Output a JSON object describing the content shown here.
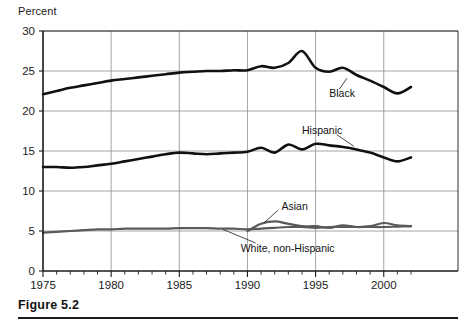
{
  "figure": {
    "caption": "Figure 5.2",
    "axis_title": "Percent"
  },
  "chart_data": {
    "type": "line",
    "title": "",
    "xlabel": "",
    "ylabel": "Percent",
    "xlim": [
      1975,
      2002
    ],
    "ylim": [
      0,
      30
    ],
    "yticks": [
      0,
      5,
      10,
      15,
      20,
      25,
      30
    ],
    "ytick_labels": [
      "0",
      "5",
      "10",
      "15",
      "20",
      "25",
      "30"
    ],
    "xticks": [
      1975,
      1980,
      1985,
      1990,
      1995,
      2000
    ],
    "xtick_labels": [
      "1975",
      "1980",
      "1985",
      "1990",
      "1995",
      "2000"
    ],
    "minor_xtick_interval": 1,
    "grid": "horizontal and vertical at major ticks",
    "legend": "inline annotations with leader lines",
    "series": [
      {
        "name": "Black",
        "label": "Black",
        "color": "#111111",
        "width": 2.6,
        "x": [
          1975,
          1976,
          1977,
          1978,
          1979,
          1980,
          1981,
          1982,
          1983,
          1984,
          1985,
          1986,
          1987,
          1988,
          1989,
          1990,
          1991,
          1992,
          1993,
          1994,
          1995,
          1996,
          1997,
          1998,
          1999,
          2000,
          2001,
          2002
        ],
        "values": [
          22.1,
          22.5,
          22.9,
          23.2,
          23.5,
          23.8,
          24.0,
          24.2,
          24.4,
          24.6,
          24.8,
          24.9,
          25.0,
          25.0,
          25.1,
          25.1,
          25.6,
          25.4,
          26.0,
          27.5,
          25.4,
          24.9,
          25.4,
          24.5,
          23.8,
          23.0,
          22.2,
          23.0
        ]
      },
      {
        "name": "Hispanic",
        "label": "Hispanic",
        "color": "#111111",
        "width": 2.6,
        "x": [
          1975,
          1976,
          1977,
          1978,
          1979,
          1980,
          1981,
          1982,
          1983,
          1984,
          1985,
          1986,
          1987,
          1988,
          1989,
          1990,
          1991,
          1992,
          1993,
          1994,
          1995,
          1996,
          1997,
          1998,
          1999,
          2000,
          2001,
          2002
        ],
        "values": [
          13.0,
          13.0,
          12.9,
          13.0,
          13.2,
          13.4,
          13.7,
          14.0,
          14.3,
          14.6,
          14.8,
          14.7,
          14.6,
          14.7,
          14.8,
          14.9,
          15.4,
          14.8,
          15.8,
          15.2,
          15.9,
          15.7,
          15.5,
          15.2,
          14.8,
          14.2,
          13.7,
          14.2
        ]
      },
      {
        "name": "Asian",
        "label": "Asian",
        "color": "#5a5a5a",
        "width": 2.2,
        "x": [
          1990,
          1991,
          1992,
          1993,
          1994,
          1995,
          1996,
          1997,
          1998,
          1999,
          2000,
          2001,
          2002
        ],
        "values": [
          5.0,
          5.9,
          6.2,
          5.9,
          5.6,
          5.6,
          5.4,
          5.7,
          5.5,
          5.6,
          6.0,
          5.7,
          5.6
        ]
      },
      {
        "name": "White, non-Hispanic",
        "label": "White, non-Hispanic",
        "color": "#5a5a5a",
        "width": 2.2,
        "x": [
          1975,
          1976,
          1977,
          1978,
          1979,
          1980,
          1981,
          1982,
          1983,
          1984,
          1985,
          1986,
          1987,
          1988,
          1989,
          1990,
          1991,
          1992,
          1993,
          1994,
          1995,
          1996,
          1997,
          1998,
          1999,
          2000,
          2001,
          2002
        ],
        "values": [
          4.8,
          4.9,
          5.0,
          5.1,
          5.2,
          5.2,
          5.3,
          5.3,
          5.3,
          5.3,
          5.35,
          5.35,
          5.35,
          5.3,
          5.3,
          5.2,
          5.3,
          5.4,
          5.5,
          5.5,
          5.4,
          5.5,
          5.5,
          5.5,
          5.5,
          5.5,
          5.55,
          5.6
        ]
      }
    ],
    "annotations": [
      {
        "text": "Black",
        "x": 1996,
        "y": 22.3
      },
      {
        "text": "Hispanic",
        "x": 1994,
        "y": 17.6
      },
      {
        "text": "Asian",
        "x": 1992.5,
        "y": 8.1
      },
      {
        "text": "White, non-Hispanic",
        "x": 1989.5,
        "y": 2.9
      }
    ]
  }
}
